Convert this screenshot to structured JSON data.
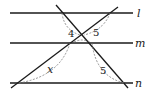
{
  "diagram": {
    "lines": [
      {
        "name": "l",
        "label": "l"
      },
      {
        "name": "m",
        "label": "m"
      },
      {
        "name": "n",
        "label": "n"
      }
    ],
    "segment_labels": {
      "upper_left": "4",
      "upper_right": "5",
      "lower_left": "x",
      "lower_right": "5"
    },
    "colors": {
      "line": "#1a1a1a",
      "dashed": "#777777"
    }
  }
}
